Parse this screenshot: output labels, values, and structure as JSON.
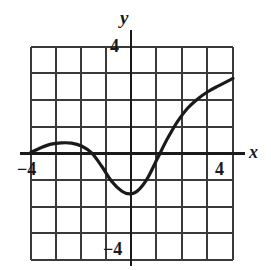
{
  "figure": {
    "name": "cartesian-function-graph",
    "background_color": "#ffffff",
    "ink_color": "#1a1a1a",
    "grid_color": "#3a3a3a"
  },
  "labels": {
    "y_axis": "y",
    "x_axis": "x",
    "tick_y_top": "4",
    "tick_y_bottom": "−4",
    "tick_x_left": "−4",
    "tick_x_right": "4"
  },
  "chart_data": {
    "type": "line",
    "title": "",
    "xlabel": "x",
    "ylabel": "y",
    "xlim": [
      -4,
      4
    ],
    "ylim": [
      -4,
      4
    ],
    "xticks": [
      -4,
      4
    ],
    "yticks": [
      -4,
      4
    ],
    "grid": true,
    "grid_step": 1,
    "legend": "none",
    "axes_style": "centered-cross",
    "series": [
      {
        "name": "f(x)",
        "x": [
          -4.0,
          -3.6,
          -3.2,
          -2.8,
          -2.4,
          -2.0,
          -1.6,
          -1.2,
          -0.8,
          -0.4,
          -0.1,
          0.2,
          0.6,
          1.0,
          1.4,
          1.8,
          2.2,
          2.6,
          3.0,
          3.4,
          4.0
        ],
        "y": [
          0.05,
          0.22,
          0.35,
          0.4,
          0.39,
          0.28,
          0.02,
          -0.48,
          -1.05,
          -1.42,
          -1.52,
          -1.42,
          -0.95,
          -0.2,
          0.55,
          1.2,
          1.7,
          2.05,
          2.32,
          2.53,
          2.82
        ]
      }
    ],
    "features": {
      "local_maximum": {
        "x": -2.6,
        "y": 0.4
      },
      "local_minimum": {
        "x": -0.1,
        "y": -1.52
      },
      "x_intercepts": [
        -4.1,
        -1.55,
        1.15
      ],
      "y_intercept": -1.45,
      "left_endpoint": {
        "x": -4,
        "y": 0.05
      },
      "right_endpoint": {
        "x": 4,
        "y": 2.82
      }
    }
  }
}
